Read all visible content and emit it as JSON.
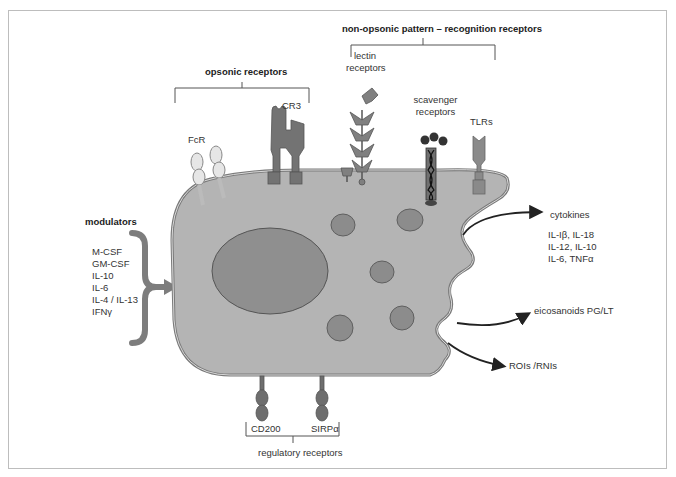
{
  "groups": {
    "non_opsonic": "non-opsonic pattern – recognition receptors",
    "opsonic": "opsonic receptors",
    "modulators": "modulators",
    "regulatory": "regulatory receptors"
  },
  "receptors": {
    "lectin": "lectin receptors",
    "lectin_line1": "lectin",
    "lectin_line2": "receptors",
    "scavenger_line1": "scavenger",
    "scavenger_line2": "receptors",
    "tlrs": "TLRs",
    "cr3": "CR3",
    "fcr": "FcR",
    "cd200": "CD200",
    "sirpa": "SIRPα"
  },
  "modulators_list": [
    "M-CSF",
    "GM-CSF",
    "IL-10",
    "IL-6",
    "IL-4 / IL-13",
    "IFNγ"
  ],
  "outputs": {
    "cytokines_title": "cytokines",
    "cytokines_list": [
      "IL-Iβ, IL-18",
      "IL-12, IL-10",
      "IL-6, TNFα"
    ],
    "eicosanoids": "eicosanoids PG/LT",
    "rois": "ROIs /RNIs"
  },
  "colors": {
    "cell_body": "#b4b4b4",
    "cell_outline": "#7a7a7a",
    "nucleus": "#8f8f8f",
    "vesicle": "#8c8c8c",
    "receptor_dark": "#737373",
    "receptor_light": "#e6e6e6",
    "arrow": "#222222"
  }
}
